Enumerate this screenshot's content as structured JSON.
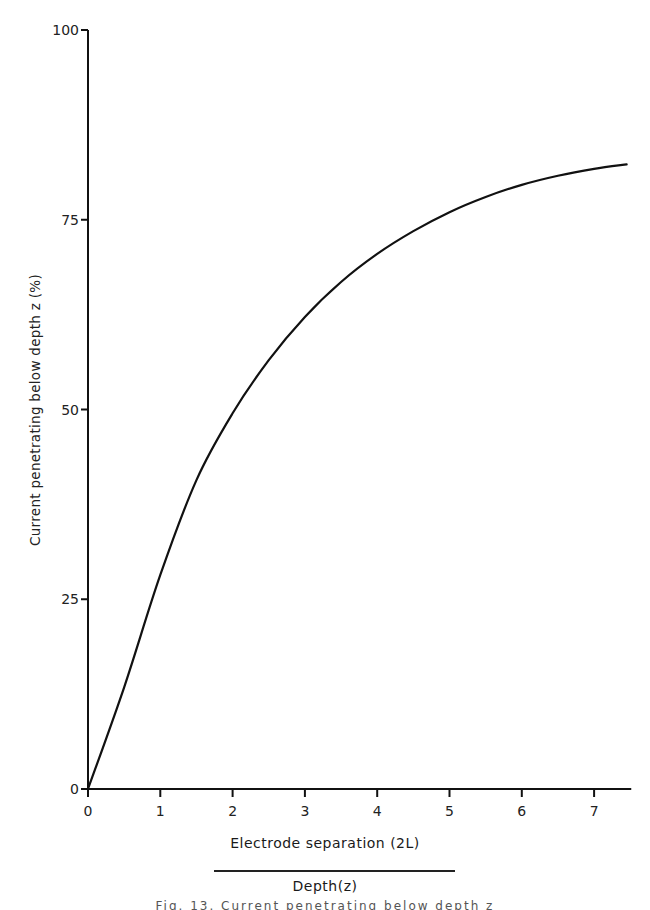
{
  "chart_data": {
    "type": "line",
    "title": "",
    "xlabel": "Electrode separation (2L) / Depth (z)",
    "xlabel_numerator": "Electrode  separation (2L)",
    "xlabel_denominator": "Depth(z)",
    "ylabel": "Current penetrating below depth z (%)",
    "xlim": [
      0,
      7.5
    ],
    "ylim": [
      0,
      100
    ],
    "x_ticks": [
      0,
      1,
      2,
      3,
      4,
      5,
      6,
      7
    ],
    "x_tick_labels": [
      "0",
      "1",
      "2",
      "3",
      "4",
      "5",
      "6",
      "7"
    ],
    "y_ticks": [
      0,
      25,
      50,
      75,
      100
    ],
    "y_tick_labels": [
      "0",
      "25",
      "50",
      "75",
      "100"
    ],
    "grid": false,
    "legend": null,
    "series": [
      {
        "name": "Current penetrating below depth z",
        "x": [
          0,
          0.5,
          1,
          1.5,
          2,
          2.5,
          3,
          3.5,
          4,
          4.5,
          5,
          5.5,
          6,
          6.5,
          7,
          7.45
        ],
        "y": [
          0,
          13.4,
          28.2,
          40.7,
          49.5,
          56.5,
          62.2,
          66.8,
          70.5,
          73.5,
          76.0,
          78.0,
          79.6,
          80.8,
          81.7,
          82.3
        ]
      }
    ],
    "caption": "Fig. 13. Current penetrating below depth z"
  },
  "layout": {
    "plot_left_px": 88,
    "plot_bottom_px": 789,
    "px_per_x_unit": 72.3,
    "px_per_y_unit": 7.59
  }
}
